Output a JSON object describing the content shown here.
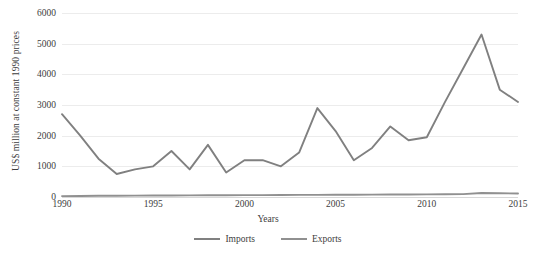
{
  "chart_data": {
    "type": "line",
    "title": "",
    "xlabel": "Years",
    "ylabel": "US$ million at constant 1990 prices",
    "xlim": [
      1990,
      2015
    ],
    "ylim": [
      0,
      6000
    ],
    "grid": true,
    "legend_position": "bottom",
    "x": [
      1990,
      1991,
      1992,
      1993,
      1994,
      1995,
      1996,
      1997,
      1998,
      1999,
      2000,
      2001,
      2002,
      2003,
      2004,
      2005,
      2006,
      2007,
      2008,
      2009,
      2010,
      2011,
      2012,
      2013,
      2014,
      2015
    ],
    "y_ticks": [
      0,
      1000,
      2000,
      3000,
      4000,
      5000,
      6000
    ],
    "x_ticks": [
      1990,
      1995,
      2000,
      2005,
      2010,
      2015
    ],
    "series": [
      {
        "name": "Imports",
        "color": "#808080",
        "values": [
          2700,
          2000,
          1250,
          750,
          900,
          1000,
          1500,
          900,
          1700,
          800,
          1200,
          1200,
          1000,
          1450,
          2900,
          2150,
          1200,
          1600,
          2300,
          1850,
          1950,
          3100,
          4200,
          5300,
          3500,
          3100
        ]
      },
      {
        "name": "Exports",
        "color": "#909090",
        "values": [
          30,
          35,
          40,
          42,
          45,
          48,
          50,
          52,
          55,
          58,
          60,
          62,
          65,
          68,
          70,
          72,
          75,
          78,
          80,
          82,
          85,
          88,
          95,
          130,
          120,
          115
        ]
      }
    ]
  },
  "legend": {
    "items": [
      {
        "label": "Imports",
        "color": "#808080"
      },
      {
        "label": "Exports",
        "color": "#909090"
      }
    ]
  }
}
